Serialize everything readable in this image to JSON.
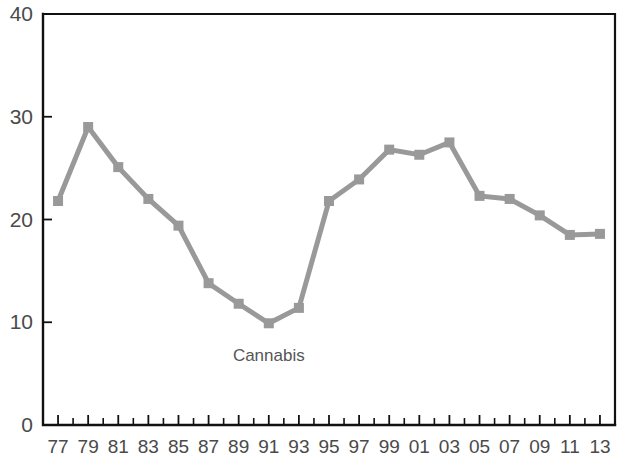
{
  "chart_data": {
    "type": "line",
    "title": "",
    "subtitle": "",
    "xlabel": "",
    "ylabel": "",
    "xlim": [
      1976,
      2014
    ],
    "ylim": [
      0,
      40
    ],
    "grid": false,
    "legend_position": "inline-annotation",
    "annotations": [
      {
        "text": "Cannabis",
        "x": 1991,
        "y": 6.2
      }
    ],
    "ytick_labels": [
      "0",
      "10",
      "20",
      "30",
      "40"
    ],
    "ytick_values": [
      0,
      10,
      20,
      30,
      40
    ],
    "xtick_labels": [
      "77",
      "79",
      "81",
      "83",
      "85",
      "87",
      "89",
      "91",
      "93",
      "95",
      "97",
      "99",
      "01",
      "03",
      "05",
      "07",
      "09",
      "11",
      "13"
    ],
    "xtick_values": [
      1977,
      1979,
      1981,
      1983,
      1985,
      1987,
      1989,
      1991,
      1993,
      1995,
      1997,
      1999,
      2001,
      2003,
      2005,
      2007,
      2009,
      2011,
      2013
    ],
    "xtick_minor_values": [
      1978,
      1980,
      1982,
      1984,
      1986,
      1988,
      1990,
      1992,
      1994,
      1996,
      1998,
      2000,
      2002,
      2004,
      2006,
      2008,
      2010,
      2012
    ],
    "series": [
      {
        "name": "Cannabis",
        "color": "#999999",
        "marker": "square",
        "x": [
          1977,
          1979,
          1981,
          1983,
          1985,
          1987,
          1989,
          1991,
          1993,
          1995,
          1997,
          1999,
          2001,
          2003,
          2005,
          2007,
          2009,
          2011,
          2013
        ],
        "values": [
          21.8,
          29.0,
          25.1,
          22.0,
          19.4,
          13.8,
          11.8,
          9.9,
          11.4,
          21.8,
          23.9,
          26.8,
          26.3,
          27.5,
          22.3,
          22.0,
          20.4,
          18.5,
          18.6
        ]
      }
    ]
  },
  "colors": {
    "series_gray": "#999999",
    "axis_black": "#111111",
    "tick_label": "#4a4a4a",
    "annotation": "#555555",
    "background": "#ffffff"
  }
}
